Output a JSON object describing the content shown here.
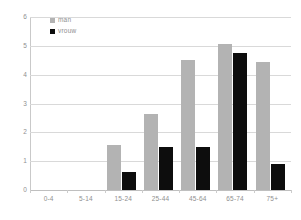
{
  "chart_data": {
    "type": "bar",
    "title": "",
    "xlabel": "",
    "ylabel": "",
    "categories": [
      "0-4",
      "5-14",
      "15-24",
      "25-44",
      "45-64",
      "65-74",
      "75+"
    ],
    "series": [
      {
        "name": "man",
        "color": "#b3b3b3",
        "values": [
          0,
          0,
          1.55,
          2.65,
          4.5,
          5.05,
          4.45
        ]
      },
      {
        "name": "vrouw",
        "color": "#0d0d0d",
        "values": [
          0,
          0,
          0.62,
          1.5,
          1.5,
          4.75,
          0.9
        ]
      }
    ],
    "ylim": [
      0,
      6
    ],
    "yticks": [
      "0",
      "1",
      "2",
      "3",
      "4",
      "5",
      "6"
    ],
    "grid": true,
    "legend_position": "top-left"
  }
}
